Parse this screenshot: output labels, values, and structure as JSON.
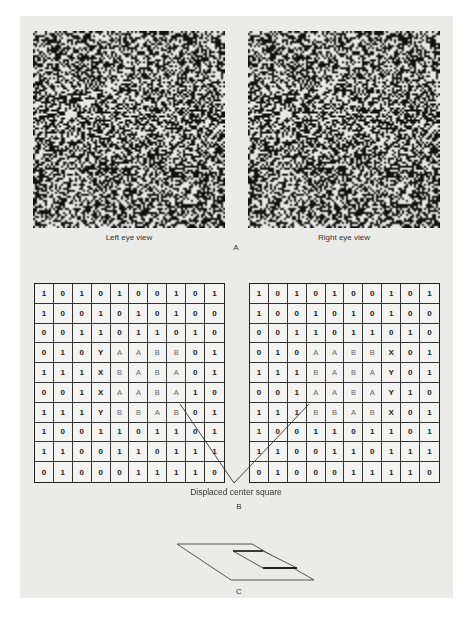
{
  "panel_a": {
    "left_caption": "Left eye view",
    "right_caption": "Right eye view",
    "panel_label": "A"
  },
  "panel_b": {
    "annotation": "Displaced center square",
    "panel_label": "B",
    "left_grid": [
      [
        "1",
        "0",
        "1",
        "0",
        "1",
        "0",
        "0",
        "1",
        "0",
        "1"
      ],
      [
        "1",
        "0",
        "0",
        "1",
        "0",
        "1",
        "0",
        "1",
        "0",
        "0"
      ],
      [
        "0",
        "0",
        "1",
        "1",
        "0",
        "1",
        "1",
        "0",
        "1",
        "0"
      ],
      [
        "0",
        "1",
        "0",
        "Y",
        "A",
        "A",
        "B",
        "B",
        "0",
        "1"
      ],
      [
        "1",
        "1",
        "1",
        "X",
        "B",
        "A",
        "B",
        "A",
        "0",
        "1"
      ],
      [
        "0",
        "0",
        "1",
        "X",
        "A",
        "A",
        "B",
        "A",
        "1",
        "0"
      ],
      [
        "1",
        "1",
        "1",
        "Y",
        "B",
        "B",
        "A",
        "B",
        "0",
        "1"
      ],
      [
        "1",
        "0",
        "0",
        "1",
        "1",
        "0",
        "1",
        "1",
        "0",
        "1"
      ],
      [
        "1",
        "1",
        "0",
        "0",
        "1",
        "1",
        "0",
        "1",
        "1",
        "1"
      ],
      [
        "0",
        "1",
        "0",
        "0",
        "0",
        "1",
        "1",
        "1",
        "1",
        "0"
      ]
    ],
    "right_grid": [
      [
        "1",
        "0",
        "1",
        "0",
        "1",
        "0",
        "0",
        "1",
        "0",
        "1"
      ],
      [
        "1",
        "0",
        "0",
        "1",
        "0",
        "1",
        "0",
        "1",
        "0",
        "0"
      ],
      [
        "0",
        "0",
        "1",
        "1",
        "0",
        "1",
        "1",
        "0",
        "1",
        "0"
      ],
      [
        "0",
        "1",
        "0",
        "A",
        "A",
        "B",
        "B",
        "X",
        "0",
        "1"
      ],
      [
        "1",
        "1",
        "1",
        "B",
        "A",
        "B",
        "A",
        "Y",
        "0",
        "1"
      ],
      [
        "0",
        "0",
        "1",
        "A",
        "A",
        "B",
        "A",
        "Y",
        "1",
        "0"
      ],
      [
        "1",
        "1",
        "1",
        "B",
        "B",
        "A",
        "B",
        "X",
        "0",
        "1"
      ],
      [
        "1",
        "0",
        "0",
        "1",
        "1",
        "0",
        "1",
        "1",
        "0",
        "1"
      ],
      [
        "1",
        "1",
        "0",
        "0",
        "1",
        "1",
        "0",
        "1",
        "1",
        "1"
      ],
      [
        "0",
        "1",
        "0",
        "0",
        "0",
        "1",
        "1",
        "1",
        "1",
        "0"
      ]
    ]
  },
  "panel_c": {
    "panel_label": "C"
  },
  "colors": {
    "page": "#ebebea",
    "ink": "#222222",
    "letter_gray": "#666666"
  }
}
